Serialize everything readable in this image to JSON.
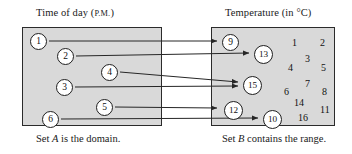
{
  "diagram": {
    "kind": "function-mapping-diagram",
    "set_a": {
      "title_main": "Time of day (",
      "title_smallcaps": "P.M.",
      "title_close": ")",
      "caption_before": "Set ",
      "caption_letter": "A",
      "caption_after": " is the domain.",
      "elements": [
        {
          "label": "1",
          "x": 30,
          "y": 33
        },
        {
          "label": "2",
          "x": 57,
          "y": 48
        },
        {
          "label": "3",
          "x": 56,
          "y": 79
        },
        {
          "label": "4",
          "x": 101,
          "y": 64
        },
        {
          "label": "5",
          "x": 96,
          "y": 99
        },
        {
          "label": "6",
          "x": 42,
          "y": 111
        }
      ]
    },
    "set_b": {
      "title_main": "Temperature (in ",
      "title_unit": "°C",
      "title_close": ")",
      "caption_before": "Set ",
      "caption_letter": "B",
      "caption_after": " contains the range.",
      "range_elements": [
        {
          "label": "9",
          "x": 222,
          "y": 34
        },
        {
          "label": "13",
          "x": 254,
          "y": 45
        },
        {
          "label": "15",
          "x": 243,
          "y": 76
        },
        {
          "label": "12",
          "x": 224,
          "y": 101
        },
        {
          "label": "10",
          "x": 263,
          "y": 110
        }
      ],
      "other_elements": [
        {
          "label": "1",
          "x": 292,
          "y": 38
        },
        {
          "label": "2",
          "x": 320,
          "y": 38
        },
        {
          "label": "3",
          "x": 305,
          "y": 54
        },
        {
          "label": "4",
          "x": 288,
          "y": 63
        },
        {
          "label": "5",
          "x": 321,
          "y": 63
        },
        {
          "label": "7",
          "x": 305,
          "y": 79
        },
        {
          "label": "6",
          "x": 284,
          "y": 87
        },
        {
          "label": "8",
          "x": 322,
          "y": 87
        },
        {
          "label": "14",
          "x": 294,
          "y": 98
        },
        {
          "label": "11",
          "x": 320,
          "y": 105
        },
        {
          "label": "16",
          "x": 298,
          "y": 113
        }
      ]
    },
    "mappings": [
      {
        "from": "1",
        "to": "9",
        "x1": 49,
        "y1": 41,
        "x2": 217,
        "y2": 41
      },
      {
        "from": "2",
        "to": "13",
        "x1": 76,
        "y1": 56,
        "x2": 249,
        "y2": 53
      },
      {
        "from": "4",
        "to": "15",
        "x1": 120,
        "y1": 72,
        "x2": 238,
        "y2": 82
      },
      {
        "from": "3",
        "to": "15",
        "x1": 75,
        "y1": 87,
        "x2": 238,
        "y2": 86
      },
      {
        "from": "5",
        "to": "12",
        "x1": 115,
        "y1": 107,
        "x2": 217,
        "y2": 108
      },
      {
        "from": "6",
        "to": "10",
        "x1": 61,
        "y1": 119,
        "x2": 258,
        "y2": 118
      }
    ],
    "colors": {
      "set_fill": "#d9d9d9",
      "set_border": "#2b2b2b",
      "node_fill": "#ffffff",
      "node_border": "#1f1f1f",
      "arrow": "#262626",
      "text": "#111111",
      "page_background": "#ffffff"
    }
  }
}
